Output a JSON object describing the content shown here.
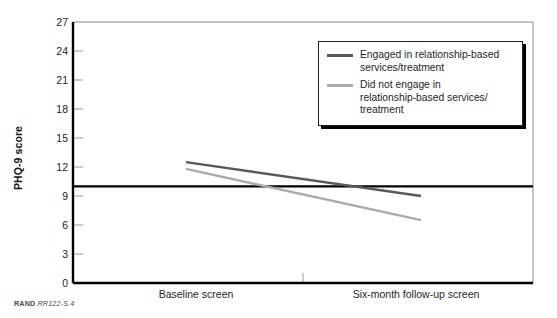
{
  "figure": {
    "caption_brand": "RAND",
    "caption_id": "RR122-S.4"
  },
  "colors": {
    "engaged_line": "#595959",
    "not_engaged_line": "#aaaaaa",
    "axis": "#000000",
    "reference_line": "#000000",
    "frame": "#808080",
    "text": "#231f20"
  },
  "chart_data": {
    "type": "line",
    "title": "",
    "subtitle": "",
    "xlabel": "",
    "ylabel": "PHQ-9 score",
    "ylim": [
      0,
      27
    ],
    "yticks": [
      0,
      3,
      6,
      9,
      12,
      15,
      18,
      21,
      24,
      27
    ],
    "ytick_labels": [
      "0",
      "3",
      "6",
      "9",
      "12",
      "15",
      "18",
      "21",
      "24",
      "27"
    ],
    "x": [
      "Baseline screen",
      "Six-month follow-up screen"
    ],
    "xtick_labels": [
      "Baseline screen",
      "Six-month follow-up screen"
    ],
    "grid": false,
    "legend_position": "top-right",
    "series": [
      {
        "name": "Engaged in relationship-based services/treatment",
        "values": [
          12.5,
          9.0
        ],
        "color": "#595959"
      },
      {
        "name": "Did not engage in relationship-based services/treatment",
        "values": [
          11.8,
          6.5
        ],
        "color": "#aaaaaa"
      }
    ],
    "annotations": [
      {
        "type": "hline",
        "label": "clinical cutoff",
        "value": 10,
        "color": "#000000"
      }
    ]
  },
  "legend": {
    "items": [
      {
        "label": "Engaged in relationship-based\nservices/treatment",
        "color": "#595959"
      },
      {
        "label": "Did not engage in\nrelationship-based services/\ntreatment",
        "color": "#aaaaaa"
      }
    ]
  }
}
